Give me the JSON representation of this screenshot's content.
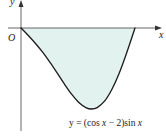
{
  "figure": {
    "type": "function-graph",
    "function": "y = (cos x − 2) sin x",
    "domain": [
      0,
      3.1416
    ],
    "shaded_region": "area between curve and x-axis from 0 to π",
    "colors": {
      "fill": "#e2f2ee",
      "curve": "#1a1a1a",
      "axis": "#555555"
    }
  },
  "labels": {
    "y_axis": "y",
    "x_axis": "x",
    "origin": "O",
    "equation_prefix": "y = (cos ",
    "equation_x1": "x",
    "equation_mid": " − 2)sin ",
    "equation_x2": "x"
  },
  "curve_points_px": [
    [
      21,
      28
    ],
    [
      28.3,
      35.5
    ],
    [
      35.5,
      43.5
    ],
    [
      42.8,
      52.4
    ],
    [
      50,
      62.4
    ],
    [
      57.3,
      73.2
    ],
    [
      64.5,
      84.2
    ],
    [
      71.8,
      94.4
    ],
    [
      79.1,
      102.7
    ],
    [
      86.3,
      107.8
    ],
    [
      91.6,
      109
    ],
    [
      97.2,
      107.6
    ],
    [
      104.5,
      101.2
    ],
    [
      111.7,
      89.7
    ],
    [
      119,
      73.7
    ],
    [
      126.2,
      54.2
    ],
    [
      135,
      28
    ]
  ]
}
